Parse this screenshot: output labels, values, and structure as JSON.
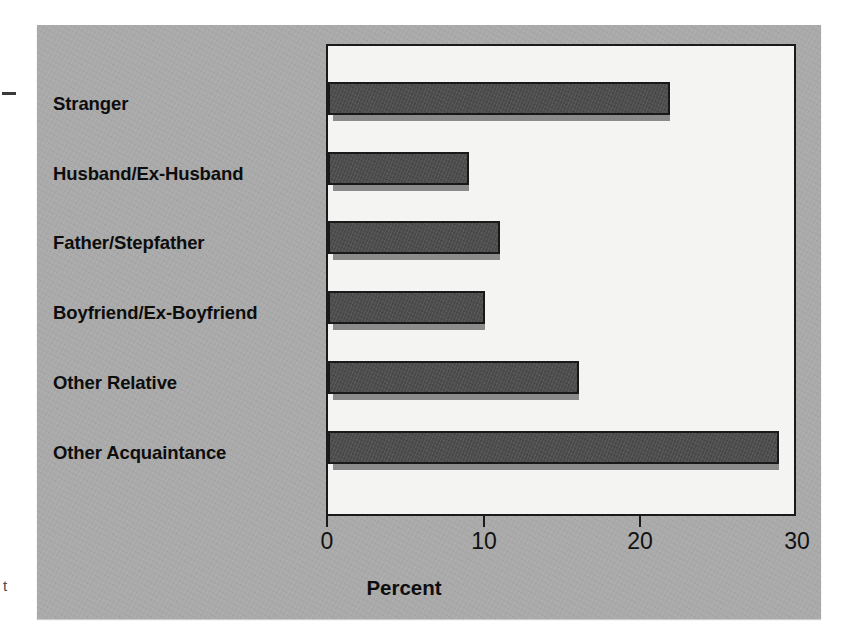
{
  "chart_data": {
    "type": "bar",
    "orientation": "horizontal",
    "title": "",
    "xlabel": "Percent",
    "ylabel": "",
    "categories": [
      "Stranger",
      "Husband/Ex-Husband",
      "Father/Stepfather",
      "Boyfriend/Ex-Boyfriend",
      "Other Relative",
      "Other Acquaintance"
    ],
    "values": [
      21.8,
      9.0,
      11.0,
      10.0,
      16.0,
      28.8
    ],
    "xlim": [
      0,
      30
    ],
    "xticks": [
      0,
      10,
      20,
      30
    ],
    "xticklabels": [
      "0",
      "10",
      "20",
      "30"
    ],
    "grid": false,
    "legend": false,
    "bar_style": "3d-shadow",
    "colors": {
      "panel_background": "#aaaaaa",
      "plot_background": "#f4f4f2",
      "bar_fill": "#4d4d4d",
      "bar_shadow": "#8b8b8b",
      "bar_outline": "#191919",
      "axis": "#1a1a1a",
      "text": "#0d0d0d"
    }
  },
  "artifacts": {
    "margin_mark_bottom": "t"
  }
}
